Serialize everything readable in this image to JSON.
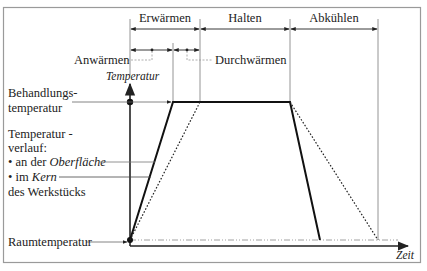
{
  "diagram": {
    "phases": {
      "erwaermen": "Erwärmen",
      "halten": "Halten",
      "abkuehlen": "Abkühlen",
      "anwaermen": "Anwärmen",
      "durchwaermen": "Durchwärmen"
    },
    "axes": {
      "y_label": "Temperatur",
      "x_label": "Zeit"
    },
    "levels": {
      "behandlung_line1": "Behandlungs-",
      "behandlung_line2": "temperatur",
      "raum": "Raumtemperatur"
    },
    "legend": {
      "line1": "Temperatur -",
      "line2": "verlauf:",
      "item1_prefix": "• an der ",
      "item1_emph": "Oberfläche",
      "item2_prefix": "• im ",
      "item2_emph": "Kern",
      "line_last": "des Werkstücks"
    },
    "series": [
      {
        "name": "Oberfläche",
        "style": "solid"
      },
      {
        "name": "Kern",
        "style": "dotted"
      }
    ],
    "colors": {
      "line": "#1a1a1a",
      "guide": "#888888",
      "frame": "#9a9a9a"
    }
  }
}
